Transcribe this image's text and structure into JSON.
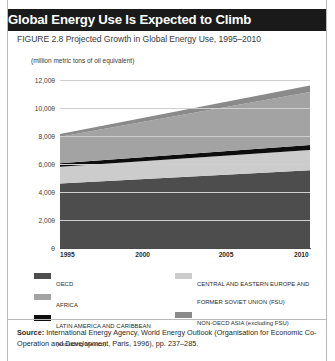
{
  "header": {
    "title": "Global Energy Use Is Expected to Climb",
    "figure_caption": "FIGURE 2.8   Projected Growth in Global Energy Use, 1995–2010"
  },
  "source": {
    "label": "Source:",
    "text": " International Energy Agency, World Energy Outlook (Organisation for Economic Co-Operation and Development, Paris, 1996), pp. 237–285."
  },
  "legend": {
    "left": [
      {
        "label": "OECD",
        "color": "#4d4d4d"
      },
      {
        "label": "AFRICA",
        "color": "#a3a3a3"
      },
      {
        "label": "LATIN AMERICA AND CARIBBEAN (excluding Mexico)",
        "color": "#0d0d0d"
      }
    ],
    "right": [
      {
        "label": "CENTRAL AND EASTERN EUROPE AND FORMER SOVIET UNION (FSU)",
        "color": "#cccccc"
      },
      {
        "label": "NON-OECD ASIA (excluding FSU)",
        "color": "#8a8a8a"
      }
    ]
  },
  "chart_data": {
    "type": "area",
    "title": "Global Energy Use Is Expected to Climb",
    "subtitle": "FIGURE 2.8   Projected Growth in Global Energy Use, 1995–2010",
    "ylabel": "(million metric tons of oil equivalent)",
    "xlabel": "",
    "stacked": true,
    "grid": true,
    "legend_position": "bottom",
    "x": [
      1995,
      2010
    ],
    "x_tick_labels": [
      "1995",
      "2000",
      "2005",
      "2010"
    ],
    "x_ticks": [
      1995,
      2000,
      2005,
      2010
    ],
    "xlim": [
      1995,
      2010
    ],
    "ylim": [
      0,
      12000
    ],
    "y_ticks": [
      0,
      2000,
      4000,
      6000,
      8000,
      10000,
      12000
    ],
    "y_tick_labels": [
      "0",
      "2,000",
      "4,000",
      "6,000",
      "8,000",
      "10,000",
      "12,000"
    ],
    "series": [
      {
        "name": "OECD",
        "color": "#4d4d4d",
        "values": [
          4600,
          5550
        ]
      },
      {
        "name": "CENTRAL AND EASTERN EUROPE AND FORMER SOVIET UNION (FSU)",
        "color": "#cccccc",
        "values": [
          1200,
          1450
        ]
      },
      {
        "name": "LATIN AMERICA AND CARIBBEAN (excluding Mexico)",
        "color": "#0d0d0d",
        "values": [
          250,
          350
        ]
      },
      {
        "name": "AFRICA",
        "color": "#a3a3a3",
        "values": [
          1900,
          3800
        ]
      },
      {
        "name": "NON-OECD ASIA (excluding FSU)",
        "color": "#8a8a8a",
        "values": [
          200,
          450
        ]
      }
    ],
    "cumulative_tops": {
      "1995": [
        4600,
        5800,
        6050,
        7950,
        8150
      ],
      "2010": [
        5550,
        7000,
        7350,
        11150,
        11600
      ]
    }
  }
}
